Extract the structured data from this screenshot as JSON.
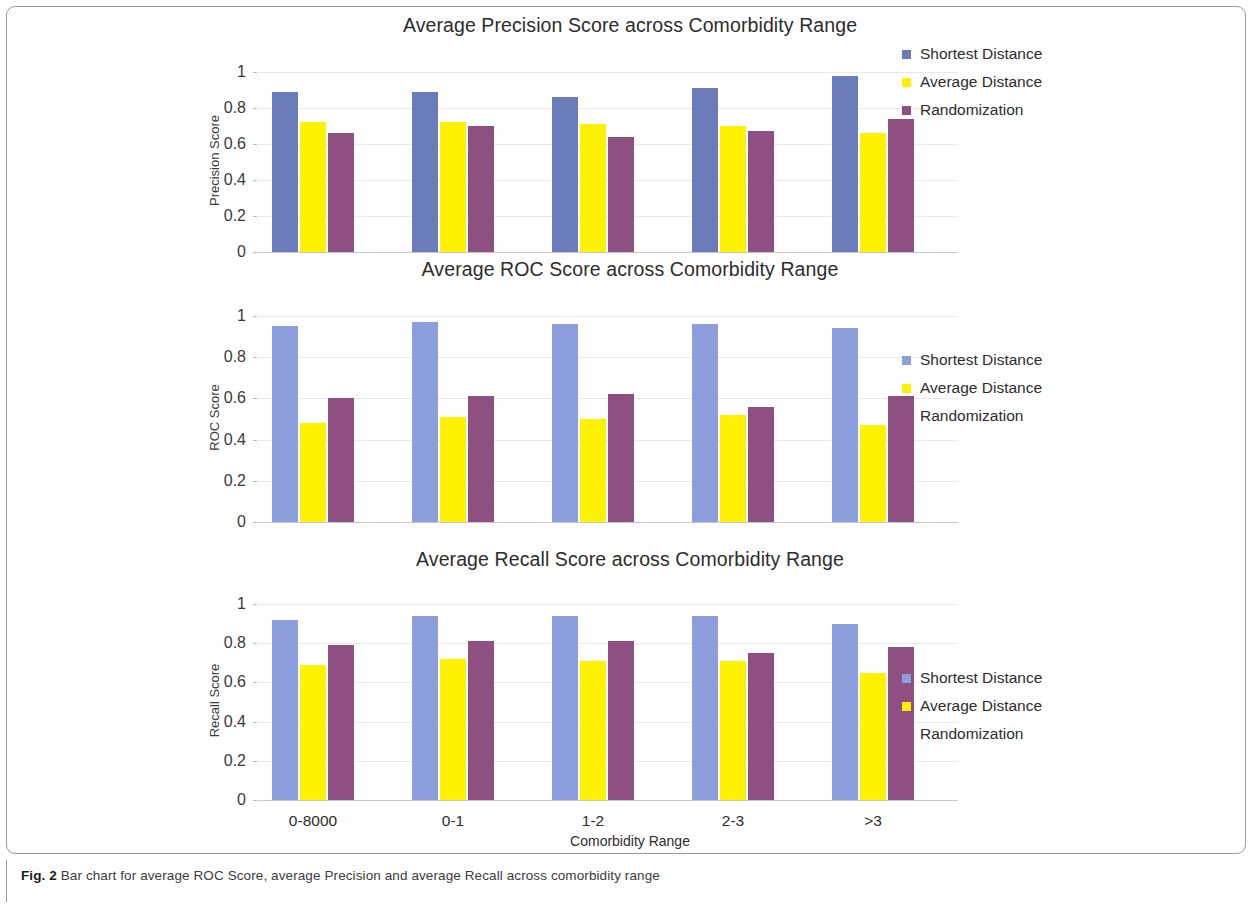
{
  "figure": {
    "caption_prefix": "Fig. 2",
    "caption_text": "Bar chart for average ROC Score, average Precision and average Recall across comorbidity range"
  },
  "colors": {
    "shortest_distance_precision": "#6b7cba",
    "shortest_distance_light": "#8d9edd",
    "average_distance": "#fff200",
    "randomization": "#8e4f82",
    "gridline": "#e8e8ee",
    "axis": "#c8c8d0",
    "text": "#2d2d2d"
  },
  "xlabel": "Comorbidity Range",
  "categories": [
    "0-8000",
    "0-1",
    "1-2",
    "2-3",
    ">3"
  ],
  "yticks": [
    "1",
    "0.8",
    "0.6",
    "0.4",
    "0.2",
    "0"
  ],
  "series_names": [
    "Shortest Distance",
    "Average Distance",
    "Randomization"
  ],
  "chart_data": [
    {
      "type": "bar",
      "title": "Average Precision Score across Comorbidity Range",
      "xlabel": "",
      "ylabel": "Precision Score",
      "categories": [
        "0-8000",
        "0-1",
        "1-2",
        "2-3",
        ">3"
      ],
      "ylim": [
        0,
        1
      ],
      "yticks": [
        0,
        0.2,
        0.4,
        0.6,
        0.8,
        1
      ],
      "grid": true,
      "legend_position": "right",
      "series": [
        {
          "name": "Shortest Distance",
          "color": "#6b7cba",
          "values": [
            0.89,
            0.89,
            0.86,
            0.91,
            0.98
          ]
        },
        {
          "name": "Average Distance",
          "color": "#fff200",
          "values": [
            0.72,
            0.72,
            0.71,
            0.7,
            0.66
          ]
        },
        {
          "name": "Randomization",
          "color": "#8e4f82",
          "values": [
            0.66,
            0.7,
            0.64,
            0.67,
            0.74
          ]
        }
      ]
    },
    {
      "type": "bar",
      "title": "Average ROC Score across Comorbidity Range",
      "xlabel": "",
      "ylabel": "ROC Score",
      "categories": [
        "0-8000",
        "0-1",
        "1-2",
        "2-3",
        ">3"
      ],
      "ylim": [
        0,
        1
      ],
      "yticks": [
        0,
        0.2,
        0.4,
        0.6,
        0.8,
        1
      ],
      "grid": true,
      "legend_position": "right",
      "series": [
        {
          "name": "Shortest Distance",
          "color": "#8d9edd",
          "values": [
            0.95,
            0.97,
            0.96,
            0.96,
            0.94
          ]
        },
        {
          "name": "Average Distance",
          "color": "#fff200",
          "values": [
            0.48,
            0.51,
            0.5,
            0.52,
            0.47
          ]
        },
        {
          "name": "Randomization",
          "color": "#8e4f82",
          "values": [
            0.6,
            0.61,
            0.62,
            0.56,
            0.61
          ]
        }
      ]
    },
    {
      "type": "bar",
      "title": "Average Recall Score across Comorbidity Range",
      "xlabel": "Comorbidity Range",
      "ylabel": "Recall Score",
      "categories": [
        "0-8000",
        "0-1",
        "1-2",
        "2-3",
        ">3"
      ],
      "ylim": [
        0,
        1
      ],
      "yticks": [
        0,
        0.2,
        0.4,
        0.6,
        0.8,
        1
      ],
      "grid": true,
      "legend_position": "right",
      "series": [
        {
          "name": "Shortest Distance",
          "color": "#8d9edd",
          "values": [
            0.92,
            0.94,
            0.94,
            0.94,
            0.9
          ]
        },
        {
          "name": "Average Distance",
          "color": "#fff200",
          "values": [
            0.69,
            0.72,
            0.71,
            0.71,
            0.65
          ]
        },
        {
          "name": "Randomization",
          "color": "#8e4f82",
          "values": [
            0.79,
            0.81,
            0.81,
            0.75,
            0.78
          ]
        }
      ]
    }
  ]
}
